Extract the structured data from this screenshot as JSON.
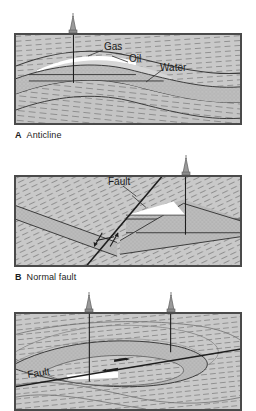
{
  "figure": {
    "background_color": "#ffffff",
    "rock_fill": "#c8c8c8",
    "reservoir_fill": "#bdbdbd",
    "gas_fill": "#ffffff",
    "line_color": "#3a3a3a"
  },
  "panels": [
    {
      "id": "A",
      "caption_label": "A",
      "caption_text": "Anticline",
      "annotations": [
        {
          "name": "gas-label",
          "text": "Gas",
          "x": 104,
          "y": 48
        },
        {
          "name": "oil-label",
          "text": "Oil",
          "x": 129,
          "y": 60
        },
        {
          "name": "water-label",
          "text": "Water",
          "x": 160,
          "y": 68
        }
      ],
      "wells": [
        {
          "name": "well-derrick-a1",
          "x": 73,
          "y": 16,
          "depth": 60
        }
      ]
    },
    {
      "id": "B",
      "caption_label": "B",
      "caption_text": "Normal fault",
      "annotations": [
        {
          "name": "fault-label",
          "text": "Fault",
          "x": 108,
          "y": 182
        }
      ],
      "wells": [
        {
          "name": "well-derrick-b1",
          "x": 186,
          "y": 158,
          "depth": 62
        }
      ]
    },
    {
      "id": "C",
      "caption_label": "",
      "caption_text": "",
      "annotations": [
        {
          "name": "fault-label",
          "text": "Fault",
          "x": 30,
          "y": 372
        }
      ],
      "wells": [
        {
          "name": "well-derrick-c1",
          "x": 89,
          "y": 295,
          "depth": 80
        },
        {
          "name": "well-derrick-c2",
          "x": 171,
          "y": 295,
          "depth": 50
        }
      ]
    }
  ],
  "labels": {
    "gas": "Gas",
    "oil": "Oil",
    "water": "Water",
    "fault": "Fault",
    "anticline": "Anticline",
    "normal_fault": "Normal fault",
    "a": "A",
    "b": "B"
  }
}
